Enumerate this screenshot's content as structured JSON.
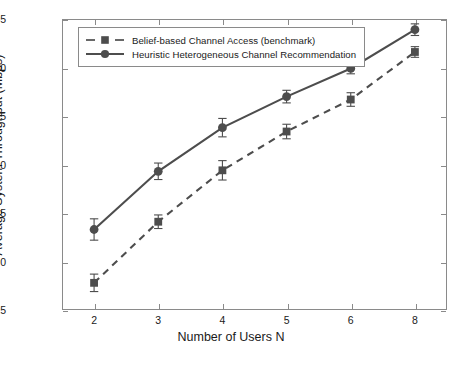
{
  "chart_data": {
    "type": "line",
    "title": "",
    "xlabel": "Number of Users N",
    "ylabel": "Average System Throughput (Mbps)",
    "categories": [
      "2",
      "3",
      "4",
      "5",
      "6",
      "8"
    ],
    "ylim": [
      15,
      45
    ],
    "yticks": [
      15,
      20,
      25,
      30,
      35,
      40,
      45
    ],
    "grid": false,
    "legend_position": "top-left",
    "series": [
      {
        "name": "Belief-based Channel Access (benchmark)",
        "marker": "square",
        "linestyle": "dashed",
        "color": "#4d4d4d",
        "values": [
          17.8,
          24.1,
          29.4,
          33.4,
          36.7,
          41.6
        ],
        "errors": [
          0.9,
          0.7,
          1.0,
          0.75,
          0.7,
          0.55
        ]
      },
      {
        "name": "Heuristic Heterogeneous Channel Recommendation",
        "marker": "circle",
        "linestyle": "solid",
        "color": "#4d4d4d",
        "values": [
          23.3,
          29.3,
          33.8,
          37.0,
          39.9,
          43.9
        ],
        "errors": [
          1.1,
          0.85,
          0.95,
          0.65,
          0.55,
          0.6
        ]
      }
    ]
  },
  "caption": {
    "text": ""
  },
  "colors": {
    "axis": "#8a8a8a",
    "series": "#4d4d4d",
    "text": "#1a1a1a",
    "background": "#ffffff"
  }
}
